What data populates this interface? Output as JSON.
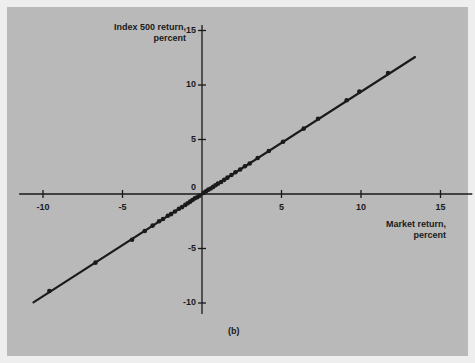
{
  "figure": {
    "caption": "(b)",
    "background_color": "#b9b9b9",
    "frame_color": "#eeeeee",
    "ink_color": "#1a1a1a"
  },
  "chart_data": {
    "type": "scatter",
    "title": "",
    "subtitle": "",
    "caption": "(b)",
    "xlabel_line1": "Market return,",
    "xlabel_line2": "percent",
    "ylabel_line1": "Index 500 return,",
    "ylabel_line2": "percent",
    "xlabel": "Market return, percent",
    "ylabel": "Index 500 return, percent",
    "xlim": [
      -11.5,
      17.0
    ],
    "ylim": [
      -11.0,
      15.5
    ],
    "xticks": [
      -10,
      -5,
      5,
      10,
      15
    ],
    "xtick_labels": [
      "-10",
      "-5",
      "5",
      "10",
      "15"
    ],
    "yticks": [
      15,
      10,
      5,
      0,
      -5,
      -10
    ],
    "ytick_labels": [
      "15",
      "10",
      "5",
      "0",
      "-5",
      "-10"
    ],
    "grid": false,
    "legend": null,
    "axes_style": "crossed-at-origin",
    "fit_line": {
      "name": "regression line",
      "slope": 0.938,
      "intercept": 0.0,
      "x_start": -10.6,
      "x_end": 13.4,
      "color": "#1a1a1a"
    },
    "series": [
      {
        "name": "Index 500 vs Market return",
        "marker": "filled-circle",
        "color": "#1a1a1a",
        "x": [
          -9.6,
          -6.7,
          -4.4,
          -3.6,
          -3.1,
          -2.7,
          -2.45,
          -2.15,
          -1.95,
          -1.7,
          -1.45,
          -1.25,
          -1.05,
          -0.9,
          -0.75,
          -0.6,
          -0.45,
          -0.3,
          -0.15,
          0.1,
          0.25,
          0.4,
          0.55,
          0.7,
          0.85,
          1.0,
          1.2,
          1.4,
          1.6,
          1.85,
          2.1,
          2.4,
          2.7,
          3.0,
          3.5,
          4.2,
          5.1,
          6.4,
          7.3,
          9.1,
          9.9,
          11.7
        ],
        "y": [
          -8.9,
          -6.3,
          -4.2,
          -3.4,
          -2.9,
          -2.5,
          -2.3,
          -2.0,
          -1.85,
          -1.6,
          -1.35,
          -1.2,
          -1.0,
          -0.85,
          -0.7,
          -0.55,
          -0.4,
          -0.3,
          -0.15,
          0.1,
          0.25,
          0.4,
          0.5,
          0.65,
          0.8,
          0.95,
          1.1,
          1.3,
          1.5,
          1.75,
          2.0,
          2.25,
          2.55,
          2.8,
          3.3,
          3.95,
          4.8,
          6.0,
          6.9,
          8.6,
          9.4,
          11.1
        ]
      }
    ]
  },
  "layout": {
    "origin_px": {
      "x": 202,
      "y": 194
    },
    "px_per_unit_x": 15.9,
    "px_per_unit_y": 10.9
  }
}
